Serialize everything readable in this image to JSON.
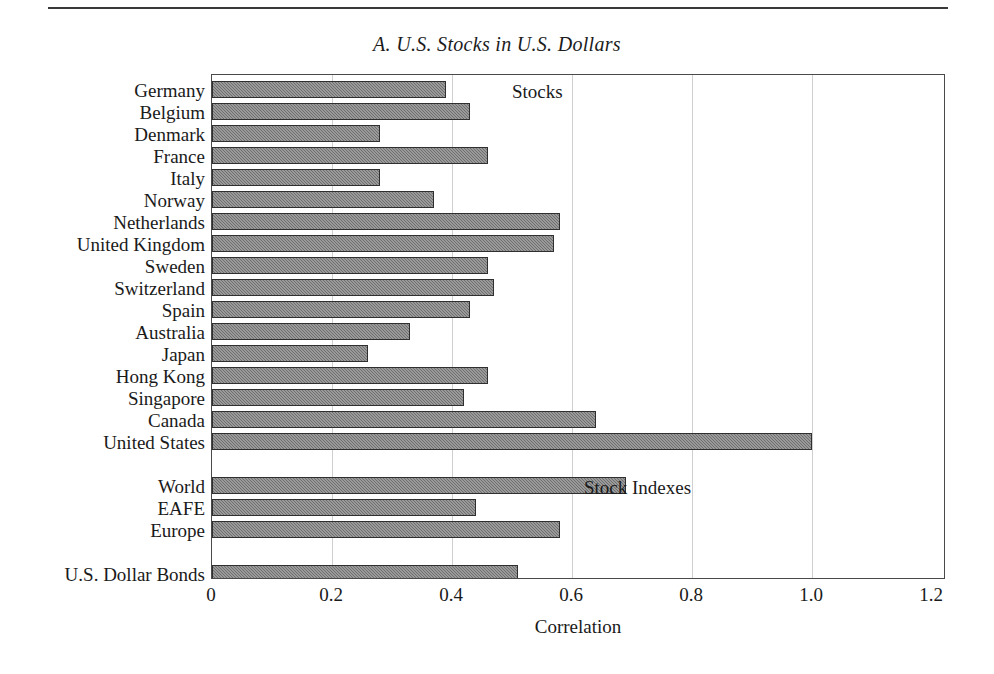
{
  "figure": {
    "title": "A. U.S. Stocks in U.S. Dollars",
    "xlabel": "Correlation",
    "group_notes": {
      "stocks": "Stocks",
      "indexes": "Stock Indexes"
    }
  },
  "chart_data": {
    "type": "bar",
    "orientation": "horizontal",
    "title": "A. U.S. Stocks in U.S. Dollars",
    "xlabel": "Correlation",
    "ylabel": "",
    "xlim": [
      0,
      1.2
    ],
    "xticks": [
      "0",
      "0.2",
      "0.4",
      "0.6",
      "0.8",
      "1.0",
      "1.2"
    ],
    "xtick_values": [
      0,
      0.2,
      0.4,
      0.6,
      0.8,
      1.0,
      1.2
    ],
    "grid": "vertical",
    "legend": "none",
    "bar_color": "#6e6e6e",
    "annotations": [
      "Stocks",
      "Stock Indexes"
    ],
    "groups": [
      {
        "name": "Stocks",
        "categories": [
          "Germany",
          "Belgium",
          "Denmark",
          "France",
          "Italy",
          "Norway",
          "Netherlands",
          "United Kingdom",
          "Sweden",
          "Switzerland",
          "Spain",
          "Australia",
          "Japan",
          "Hong Kong",
          "Singapore",
          "Canada",
          "United States"
        ],
        "values": [
          0.39,
          0.43,
          0.28,
          0.46,
          0.28,
          0.37,
          0.58,
          0.57,
          0.46,
          0.47,
          0.43,
          0.33,
          0.26,
          0.46,
          0.42,
          0.64,
          1.0
        ]
      },
      {
        "name": "Stock Indexes",
        "categories": [
          "World",
          "EAFE",
          "Europe"
        ],
        "values": [
          0.69,
          0.44,
          0.58
        ]
      },
      {
        "name": "Bonds",
        "categories": [
          "U.S. Dollar Bonds"
        ],
        "values": [
          0.51
        ]
      }
    ],
    "categories": [
      "Germany",
      "Belgium",
      "Denmark",
      "France",
      "Italy",
      "Norway",
      "Netherlands",
      "United Kingdom",
      "Sweden",
      "Switzerland",
      "Spain",
      "Australia",
      "Japan",
      "Hong Kong",
      "Singapore",
      "Canada",
      "United States",
      "World",
      "EAFE",
      "Europe",
      "U.S. Dollar Bonds"
    ],
    "values": [
      0.39,
      0.43,
      0.28,
      0.46,
      0.28,
      0.37,
      0.58,
      0.57,
      0.46,
      0.47,
      0.43,
      0.33,
      0.26,
      0.46,
      0.42,
      0.64,
      1.0,
      0.69,
      0.44,
      0.58,
      0.51
    ]
  },
  "rows": [
    {
      "label": "Germany",
      "value": 0.39,
      "slot": 0
    },
    {
      "label": "Belgium",
      "value": 0.43,
      "slot": 1
    },
    {
      "label": "Denmark",
      "value": 0.28,
      "slot": 2
    },
    {
      "label": "France",
      "value": 0.46,
      "slot": 3
    },
    {
      "label": "Italy",
      "value": 0.28,
      "slot": 4
    },
    {
      "label": "Norway",
      "value": 0.37,
      "slot": 5
    },
    {
      "label": "Netherlands",
      "value": 0.58,
      "slot": 6
    },
    {
      "label": "United Kingdom",
      "value": 0.57,
      "slot": 7
    },
    {
      "label": "Sweden",
      "value": 0.46,
      "slot": 8
    },
    {
      "label": "Switzerland",
      "value": 0.47,
      "slot": 9
    },
    {
      "label": "Spain",
      "value": 0.43,
      "slot": 10
    },
    {
      "label": "Australia",
      "value": 0.33,
      "slot": 11
    },
    {
      "label": "Japan",
      "value": 0.26,
      "slot": 12
    },
    {
      "label": "Hong Kong",
      "value": 0.46,
      "slot": 13
    },
    {
      "label": "Singapore",
      "value": 0.42,
      "slot": 14
    },
    {
      "label": "Canada",
      "value": 0.64,
      "slot": 15
    },
    {
      "label": "United States",
      "value": 1.0,
      "slot": 16
    },
    {
      "label": "World",
      "value": 0.69,
      "slot": 18
    },
    {
      "label": "EAFE",
      "value": 0.44,
      "slot": 19
    },
    {
      "label": "Europe",
      "value": 0.58,
      "slot": 20
    },
    {
      "label": "U.S. Dollar Bonds",
      "value": 0.51,
      "slot": 22
    }
  ],
  "axis": {
    "ticks": [
      {
        "label": "0",
        "value": 0
      },
      {
        "label": "0.2",
        "value": 0.2
      },
      {
        "label": "0.4",
        "value": 0.4
      },
      {
        "label": "0.6",
        "value": 0.6
      },
      {
        "label": "0.8",
        "value": 0.8
      },
      {
        "label": "1.0",
        "value": 1.0
      },
      {
        "label": "1.2",
        "value": 1.2
      }
    ]
  }
}
